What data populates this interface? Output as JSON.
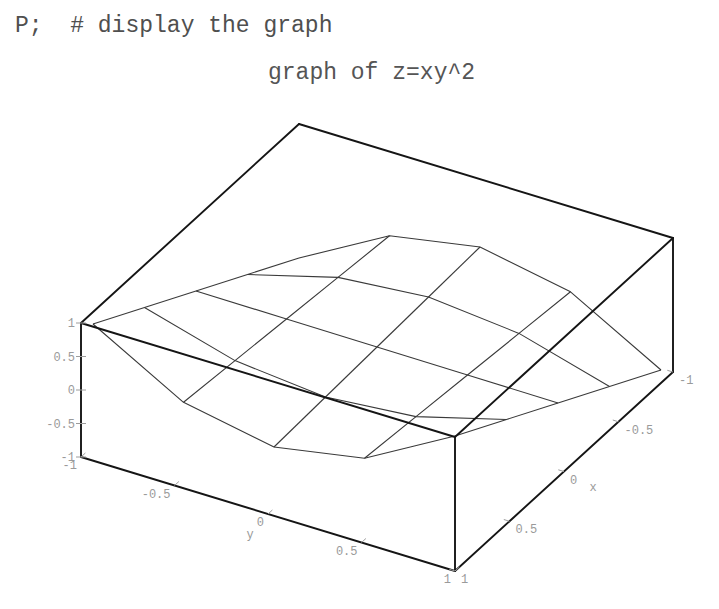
{
  "worksheet": {
    "input_line": "P;  # display the graph"
  },
  "plot": {
    "title": "graph of z=xy^2"
  },
  "colors": {
    "text": "#505050",
    "mesh": "#3a3a3a",
    "box": "#151515",
    "tick_labels": "#9a9a9a",
    "background": "#ffffff"
  },
  "chart_data": {
    "type": "surface3d",
    "title": "graph of z=xy^2",
    "function": "z = x*y^2",
    "style": "wireframe",
    "axes": "boxed",
    "grid": false,
    "x": [
      -1,
      -0.5,
      0,
      0.5,
      1
    ],
    "y": [
      -1,
      -0.5,
      0,
      0.5,
      1
    ],
    "z": [
      [
        -1,
        -0.25,
        0,
        -0.25,
        -1
      ],
      [
        -0.5,
        -0.125,
        0,
        -0.125,
        -0.5
      ],
      [
        0,
        0,
        0,
        0,
        0
      ],
      [
        0.5,
        0.125,
        0,
        0.125,
        0.5
      ],
      [
        1,
        0.25,
        0,
        0.25,
        1
      ]
    ],
    "xlabel": "x",
    "ylabel": "y",
    "zlabel": "",
    "xlim": [
      -1,
      1
    ],
    "ylim": [
      -1,
      1
    ],
    "zlim": [
      -1,
      1
    ],
    "xticks": [
      {
        "value": -1,
        "label": "-1"
      },
      {
        "value": -0.5,
        "label": "-0.5"
      },
      {
        "value": 0,
        "label": "0"
      },
      {
        "value": 0.5,
        "label": "0.5"
      },
      {
        "value": 1,
        "label": "1"
      }
    ],
    "yticks": [
      {
        "value": -1,
        "label": "-1"
      },
      {
        "value": -0.5,
        "label": "-0.5"
      },
      {
        "value": 0,
        "label": "0"
      },
      {
        "value": 0.5,
        "label": "0.5"
      },
      {
        "value": 1,
        "label": "1"
      }
    ],
    "zticks": [
      {
        "value": -1,
        "label": "-1"
      },
      {
        "value": -0.5,
        "label": "-0.5"
      },
      {
        "value": 0,
        "label": "0"
      },
      {
        "value": 0.5,
        "label": "0.5"
      },
      {
        "value": 1,
        "label": "1"
      }
    ]
  }
}
